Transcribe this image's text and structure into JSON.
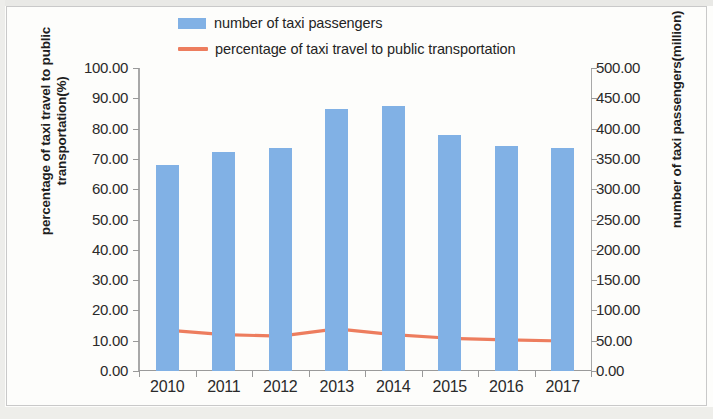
{
  "legend": {
    "position": "top-center",
    "entries": [
      {
        "label": "number of taxi passengers",
        "marker": "bar-swatch-icon",
        "color": "#81B1E5"
      },
      {
        "label": "percentage of taxi travel to public transportation",
        "marker": "line-swatch-icon",
        "color": "#ED7D5E"
      }
    ]
  },
  "axes": {
    "y_left": {
      "title": "percentage of taxi travel to public transportation(%)",
      "ticks": [
        "100.00",
        "90.00",
        "80.00",
        "70.00",
        "60.00",
        "50.00",
        "40.00",
        "30.00",
        "20.00",
        "10.00",
        "0.00"
      ],
      "min": 0,
      "max": 100
    },
    "y_right": {
      "title": "number of taxi passengers(million)",
      "ticks": [
        "500.00",
        "450.00",
        "400.00",
        "350.00",
        "300.00",
        "250.00",
        "200.00",
        "150.00",
        "100.00",
        "50.00",
        "0.00"
      ],
      "min": 0,
      "max": 500
    },
    "x": {
      "ticks": [
        "2010",
        "2011",
        "2012",
        "2013",
        "2014",
        "2015",
        "2016",
        "2017"
      ]
    }
  },
  "chart_data": {
    "type": "bar",
    "title": "",
    "subtitle": "",
    "xlabel": "",
    "ylabel": "percentage of taxi travel to public transportation(%)",
    "y2label": "number of taxi passengers(million)",
    "categories": [
      "2010",
      "2011",
      "2012",
      "2013",
      "2014",
      "2015",
      "2016",
      "2017"
    ],
    "grid": false,
    "legend_position": "top",
    "ylim": [
      0,
      100
    ],
    "y2lim": [
      0,
      500
    ],
    "series": [
      {
        "name": "number of taxi passengers",
        "type": "bar",
        "axis": "right",
        "unit": "million",
        "color": "#81B1E5",
        "values": [
          340,
          361,
          368,
          432,
          438,
          390,
          372,
          368
        ]
      },
      {
        "name": "percentage of taxi travel to public transportation",
        "type": "line",
        "axis": "left",
        "unit": "%",
        "color": "#ED7D5E",
        "values": [
          13.5,
          12.0,
          11.5,
          13.9,
          12.0,
          10.8,
          10.3,
          9.9
        ]
      }
    ]
  }
}
